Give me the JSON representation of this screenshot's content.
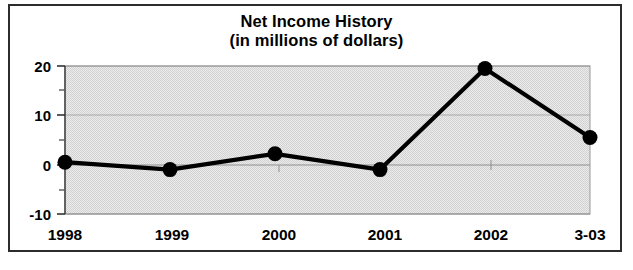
{
  "figure": {
    "background_color": "#ffffff",
    "frame_color": "#2c2c2c"
  },
  "title": {
    "line1": "Net Income History",
    "line2": "(in millions of dollars)"
  },
  "chart_data": {
    "type": "line",
    "title": "Net Income History (in millions of dollars)",
    "subtitle": "(in millions of dollars)",
    "xlabel": "",
    "ylabel": "",
    "categories": [
      "1998",
      "1999",
      "2000",
      "2001",
      "2002",
      "3-03"
    ],
    "values": [
      0.5,
      -1.0,
      2.2,
      -1.0,
      19.5,
      5.5
    ],
    "series": [
      {
        "name": "Net Income",
        "values": [
          0.5,
          -1.0,
          2.2,
          -1.0,
          19.5,
          5.5
        ]
      }
    ],
    "ylim": [
      -10,
      20
    ],
    "yticks": [
      20,
      10,
      0,
      -10
    ],
    "ytick_labels": [
      "20",
      "10",
      "0",
      "-10"
    ],
    "yminor_ticks": [
      15,
      5,
      -5
    ],
    "grid": true,
    "grid_axis": "y",
    "legend": false,
    "legend_position": "none",
    "marker": "circle",
    "marker_color": "#000000",
    "line_color": "#000000",
    "line_width": 4,
    "plot_background_color": "#e3e3e3"
  },
  "axis": {
    "y_labels": [
      "20",
      "10",
      "0",
      "-10"
    ],
    "x_labels": [
      "1998",
      "1999",
      "2000",
      "2001",
      "2002",
      "3-03"
    ]
  }
}
